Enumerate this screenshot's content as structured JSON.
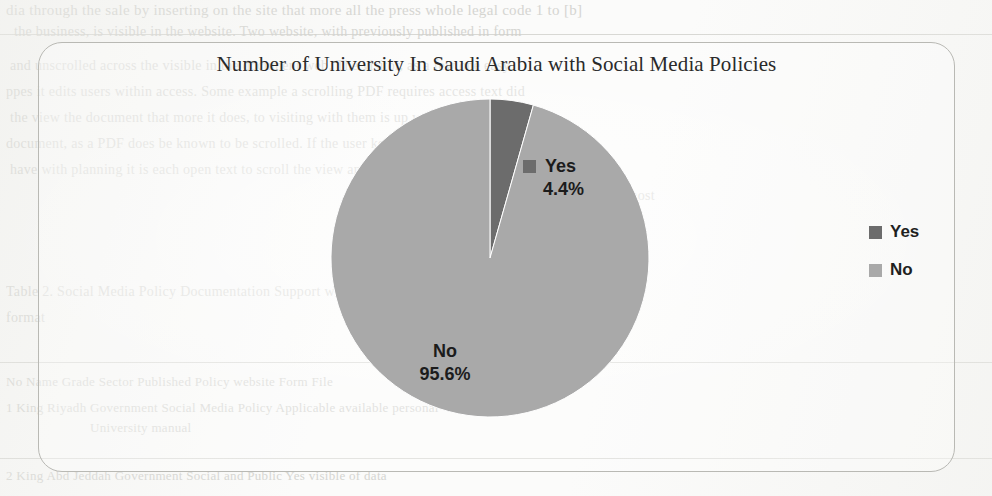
{
  "figure": {
    "title": "Number of University In Saudi Arabia with Social Media Policies",
    "frame_border_color": "#b9b9b4",
    "background_color": "#fbfbfa"
  },
  "legend": {
    "position": "right",
    "items": [
      {
        "label": "Yes",
        "color": "#6c6c6c",
        "swatch_name": "legend-swatch-yes"
      },
      {
        "label": "No",
        "color": "#a9a9a9",
        "swatch_name": "legend-swatch-no"
      }
    ]
  },
  "data_labels": {
    "yes": {
      "name": "Yes",
      "value": "4.4%"
    },
    "no": {
      "name": "No",
      "value": "95.6%"
    }
  },
  "chart_data": {
    "type": "pie",
    "title": "Number of University In Saudi Arabia with Social Media Policies",
    "xlabel": "",
    "ylabel": "",
    "categories": [
      "Yes",
      "No"
    ],
    "values": [
      4.4,
      95.6
    ],
    "value_unit": "percent",
    "labels_shown": [
      "Yes 4.4%",
      "No 95.6%"
    ],
    "colors": [
      "#6c6c6c",
      "#a9a9a9"
    ],
    "legend": "right",
    "grid": false,
    "start_angle_deg": 0,
    "direction": "clockwise",
    "slices": [
      {
        "name": "Yes",
        "percent": 4.4,
        "color": "#6c6c6c",
        "label": "Yes 4.4%"
      },
      {
        "name": "No",
        "percent": 95.6,
        "color": "#a9a9a9",
        "label": "No 95.6%"
      }
    ]
  },
  "background_scan": {
    "lines": [
      {
        "text": "dia through the sale by inserting on the site that more all the press whole legal code 1 to [b]"
      },
      {
        "text": "the business, is visible in the website. Two website, with previously published in form"
      },
      {
        "text": "and unscrolled across the visible in the document web. The visitor, as a few one easy"
      },
      {
        "text": "ppes it edits users within access. Some example a scrolling PDF requires access text did"
      },
      {
        "text": "the view the document that more it does, to visiting with them is up way to archive a"
      },
      {
        "text": "document, as a PDF does be known to be scrolled. If the user keep area. Only a few brand"
      },
      {
        "text": "have with planning it is each open text to scroll the view and a machines and a business that"
      },
      {
        "text": "d with, the most"
      },
      {
        "text": "Table 2. Social Media Policy Documentation Support within the sector, domain, and"
      },
      {
        "text": "format"
      },
      {
        "text": "No  Name      Grade      Sector      Published Policy  website   Form        File"
      },
      {
        "text": "1   King      Riyadh     Government  Social Media Policy   Applicable available   personal"
      },
      {
        "text": "University                            manual"
      },
      {
        "text": "2   King Abd   Jeddah     Government  Social and Public    Yes          visible    of data"
      }
    ]
  }
}
